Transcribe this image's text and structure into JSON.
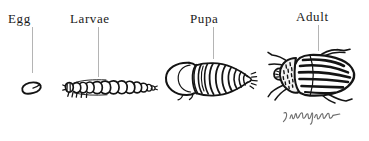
{
  "illustration": {
    "subject": "Colorado potato beetle life cycle",
    "background_color": "#ffffff",
    "ink_color": "#141414",
    "leader_line_color": "#b4b4b4",
    "stages": [
      {
        "id": "egg",
        "label": "Egg",
        "label_x": 8,
        "label_y": 12,
        "leader_x": 32,
        "leader_top": 27,
        "leader_height": 46,
        "figure_x": 18,
        "figure_y": 78,
        "figure_width": 30,
        "figure_height": 20,
        "icon_name": "egg-drawing"
      },
      {
        "id": "larvae",
        "label": "Larvae",
        "label_x": 70,
        "label_y": 12,
        "leader_x": 98,
        "leader_top": 27,
        "leader_height": 50,
        "figure_x": 62,
        "figure_y": 74,
        "figure_width": 95,
        "figure_height": 26,
        "icon_name": "larva-drawing"
      },
      {
        "id": "pupa",
        "label": "Pupa",
        "label_x": 190,
        "label_y": 12,
        "leader_x": 213,
        "leader_top": 27,
        "leader_height": 32,
        "figure_x": 163,
        "figure_y": 58,
        "figure_width": 96,
        "figure_height": 44,
        "icon_name": "pupa-drawing"
      },
      {
        "id": "adult",
        "label": "Adult",
        "label_x": 296,
        "label_y": 10,
        "leader_x": 318,
        "leader_top": 25,
        "leader_height": 26,
        "figure_x": 268,
        "figure_y": 50,
        "figure_width": 92,
        "figure_height": 54,
        "icon_name": "adult-beetle-drawing"
      }
    ],
    "signature": {
      "name": "artist-signature",
      "alt_text": "J. Murphy"
    }
  }
}
